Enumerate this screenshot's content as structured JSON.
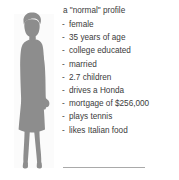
{
  "profile": {
    "title": "a \"normal\" profile",
    "bullet": "-",
    "traits": [
      {
        "label": "female"
      },
      {
        "label": "35 years of age"
      },
      {
        "label": "college educated"
      },
      {
        "label": "married"
      },
      {
        "label": "2.7 children"
      },
      {
        "label": "drives a Honda"
      },
      {
        "label": "mortgage of $256,000"
      },
      {
        "label": "plays tennis"
      },
      {
        "label": "likes Italian food"
      }
    ]
  },
  "illustration": {
    "figure_icon": "woman-silhouette-icon",
    "figure_color": "#8d8d8d",
    "band_color": "#fbfbfb"
  },
  "footer": {
    "rule_icon": "dotted-rule-icon",
    "rule_color": "#a9a9a9"
  },
  "colors": {
    "background": "#ffffff",
    "text": "#3b3b3b"
  }
}
